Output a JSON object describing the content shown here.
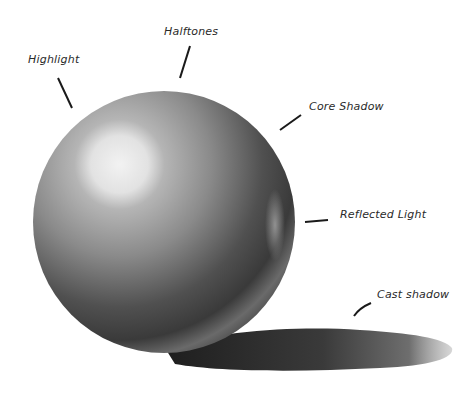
{
  "diagram": {
    "labels": [
      {
        "id": "highlight",
        "text": "Highlight"
      },
      {
        "id": "halftones",
        "text": "Halftones"
      },
      {
        "id": "core-shadow",
        "text": "Core Shadow"
      },
      {
        "id": "reflected-light",
        "text": "Reflected Light"
      },
      {
        "id": "cast-shadow",
        "text": "Cast shadow"
      }
    ],
    "colors": {
      "background": "#ffffff",
      "ink": "#2a2a2a",
      "sphere_light": "#e6e6e6",
      "sphere_mid": "#8a8a8a",
      "sphere_dark": "#3a3a3a",
      "cast_shadow": "#2e2e2e"
    }
  }
}
